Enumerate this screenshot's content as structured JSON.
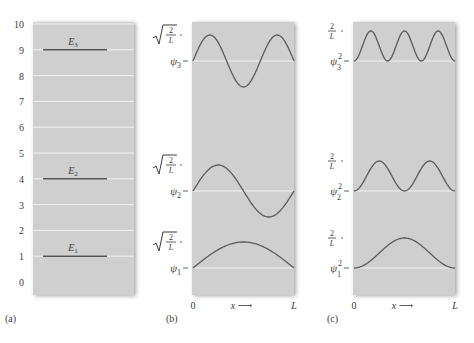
{
  "figure": {
    "panel_a": {
      "label": "(a)",
      "y_ticks": [
        "0",
        "1",
        "2",
        "3",
        "4",
        "5",
        "6",
        "7",
        "8",
        "9",
        "10"
      ],
      "levels": [
        {
          "name": "E",
          "sub": "1",
          "value": 1
        },
        {
          "name": "E",
          "sub": "2",
          "value": 4
        },
        {
          "name": "E",
          "sub": "3",
          "value": 9
        }
      ]
    },
    "panel_b": {
      "label": "(b)",
      "amplitude_label": "√(2/L)",
      "curves": [
        {
          "name": "ψ",
          "sub": "1",
          "n": 1
        },
        {
          "name": "ψ",
          "sub": "2",
          "n": 2
        },
        {
          "name": "ψ",
          "sub": "3",
          "n": 3
        }
      ],
      "x_start": "0",
      "x_axis": "x ⟶",
      "x_end": "L"
    },
    "panel_c": {
      "label": "(c)",
      "amplitude_label": "2/L",
      "curves": [
        {
          "name": "ψ",
          "sub": "1",
          "sup": "2",
          "n": 1
        },
        {
          "name": "ψ",
          "sub": "2",
          "sup": "2",
          "n": 2
        },
        {
          "name": "ψ",
          "sub": "3",
          "sup": "2",
          "n": 3
        }
      ],
      "x_start": "0",
      "x_axis": "x ⟶",
      "x_end": "L"
    }
  },
  "chart_data": [
    {
      "type": "line",
      "title": "(a) Energy levels (units of E1)",
      "ylabel": "Energy",
      "ylim": [
        0,
        10
      ],
      "y_ticks": [
        0,
        1,
        2,
        3,
        4,
        5,
        6,
        7,
        8,
        9,
        10
      ],
      "series": [
        {
          "name": "E1",
          "values": [
            1
          ]
        },
        {
          "name": "E2",
          "values": [
            4
          ]
        },
        {
          "name": "E3",
          "values": [
            9
          ]
        }
      ],
      "grid": true
    },
    {
      "type": "line",
      "title": "(b) Wave functions ψn = √(2/L) sin(nπx/L)",
      "xlabel": "x",
      "x_ticks": [
        "0",
        "L"
      ],
      "series": [
        {
          "name": "ψ1",
          "n": 1,
          "amplitude": "√(2/L)"
        },
        {
          "name": "ψ2",
          "n": 2,
          "amplitude": "√(2/L)"
        },
        {
          "name": "ψ3",
          "n": 3,
          "amplitude": "√(2/L)"
        }
      ]
    },
    {
      "type": "line",
      "title": "(c) Probability densities ψn² = (2/L) sin²(nπx/L)",
      "xlabel": "x",
      "x_ticks": [
        "0",
        "L"
      ],
      "series": [
        {
          "name": "ψ1²",
          "n": 1,
          "amplitude": "2/L"
        },
        {
          "name": "ψ2²",
          "n": 2,
          "amplitude": "2/L"
        },
        {
          "name": "ψ3²",
          "n": 3,
          "amplitude": "2/L"
        }
      ]
    }
  ]
}
